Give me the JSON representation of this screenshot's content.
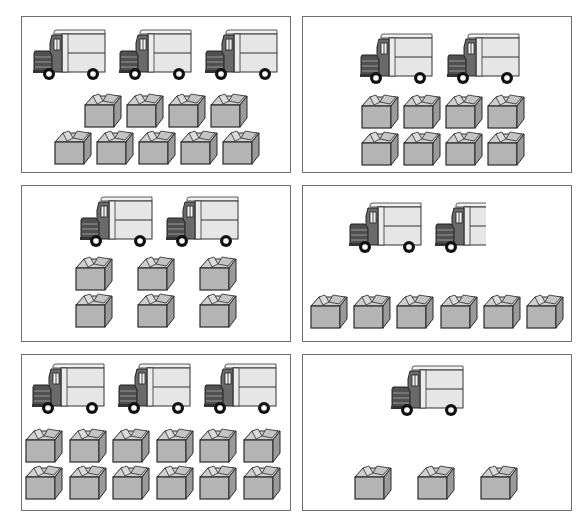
{
  "figure": {
    "colors": {
      "border": "#6e6e6e",
      "truck_body": "#e6e6e6",
      "truck_cab": "#6a6a6a",
      "truck_grille": "#505050",
      "box_front": "#b4b4b4",
      "box_top": "#cfcfcf",
      "box_side": "#9a9a9a",
      "outline": "#2a2a2a"
    },
    "panels": [
      {
        "id": 1,
        "trucks": 3,
        "boxes": 9,
        "box_rows": [
          4,
          5
        ]
      },
      {
        "id": 2,
        "trucks": 2,
        "boxes": 8,
        "box_rows": [
          4,
          4
        ]
      },
      {
        "id": 3,
        "trucks": 2,
        "boxes": 6,
        "box_rows": [
          3,
          3
        ]
      },
      {
        "id": 4,
        "trucks": 1.5,
        "boxes": 6,
        "box_rows": [
          6
        ]
      },
      {
        "id": 5,
        "trucks": 3,
        "boxes": 12,
        "box_rows": [
          6,
          6
        ]
      },
      {
        "id": 6,
        "trucks": 1,
        "boxes": 3,
        "box_rows": [
          3
        ]
      }
    ]
  }
}
